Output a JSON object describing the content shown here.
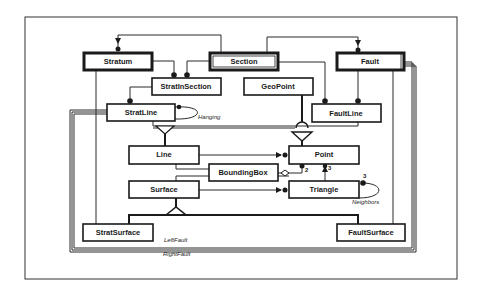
{
  "diagram": {
    "type": "object-model",
    "classes": {
      "stratum": "Stratum",
      "section": "Section",
      "fault": "Fault",
      "strat_in_section": "StratInSection",
      "geo_point": "GeoPoint",
      "strat_line": "StratLine",
      "fault_line": "FaultLine",
      "line": "Line",
      "point": "Point",
      "bounding_box": "BoundingBox",
      "surface": "Surface",
      "triangle": "Triangle",
      "strat_surface": "StratSurface",
      "fault_surface": "FaultSurface"
    },
    "roles": {
      "hanging": "Hanging",
      "neighbors": "Neighbors",
      "left_fault": "LeftFault",
      "right_fault": "RightFault"
    },
    "cardinalities": {
      "point_bbox": "2",
      "point_triangle": "3",
      "triangle_neighbors": "3"
    },
    "relationships": [
      {
        "from": "Section",
        "to": "Stratum",
        "kind": "association"
      },
      {
        "from": "Section",
        "to": "Fault",
        "kind": "association"
      },
      {
        "from": "StratInSection",
        "to": "Stratum",
        "kind": "association"
      },
      {
        "from": "StratInSection",
        "to": "Section",
        "kind": "association"
      },
      {
        "from": "StratLine",
        "to": "StratInSection",
        "kind": "association"
      },
      {
        "from": "StratLine",
        "to": "StratLine",
        "kind": "association",
        "role": "Hanging"
      },
      {
        "from": "FaultLine",
        "to": "Section",
        "kind": "association"
      },
      {
        "from": "FaultLine",
        "to": "Fault",
        "kind": "association"
      },
      {
        "from": "Line",
        "to": "StratLine",
        "kind": "generalization"
      },
      {
        "from": "Point",
        "to": "GeoPoint",
        "kind": "generalization"
      },
      {
        "from": "Line",
        "to": "Point",
        "kind": "association"
      },
      {
        "from": "BoundingBox",
        "to": "Point",
        "kind": "aggregation",
        "cardinality": "2"
      },
      {
        "from": "Triangle",
        "to": "Point",
        "kind": "association",
        "cardinality": "3"
      },
      {
        "from": "Surface",
        "to": "Triangle",
        "kind": "association"
      },
      {
        "from": "Triangle",
        "to": "Triangle",
        "kind": "association",
        "role": "Neighbors",
        "cardinality": "3"
      },
      {
        "from": "StratSurface",
        "to": "Surface",
        "kind": "generalization"
      },
      {
        "from": "FaultSurface",
        "to": "Surface",
        "kind": "generalization"
      },
      {
        "from": "StratSurface",
        "to": "Fault",
        "kind": "association",
        "role": "LeftFault"
      },
      {
        "from": "StratSurface",
        "to": "Fault",
        "kind": "association",
        "role": "RightFault"
      }
    ]
  }
}
